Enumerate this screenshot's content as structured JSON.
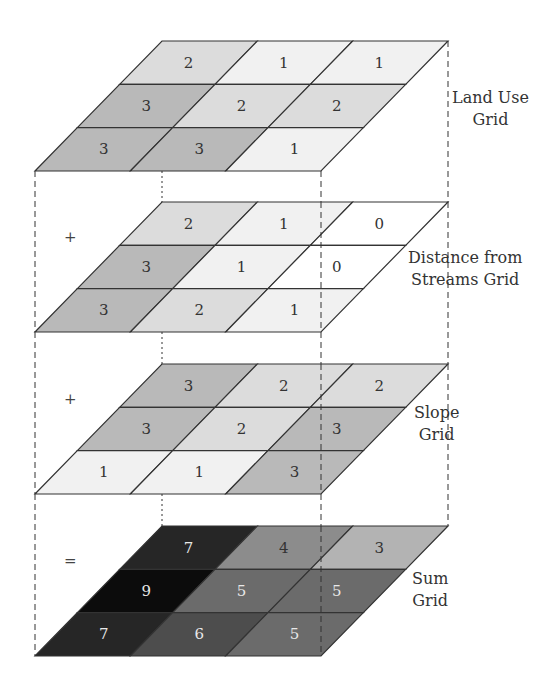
{
  "layers": [
    {
      "name": "land-use-grid",
      "label_line1": "Land Use",
      "label_line2": "Grid",
      "operator": "",
      "top_y": 41,
      "label_x": 452,
      "label_y": 109,
      "values": [
        [
          2,
          1,
          1
        ],
        [
          3,
          2,
          2
        ],
        [
          3,
          3,
          1
        ]
      ]
    },
    {
      "name": "distance-from-streams-grid",
      "label_line1": "Distance from",
      "label_line2": "Streams Grid",
      "operator": "+",
      "top_y": 202,
      "label_x": 408,
      "label_y": 269,
      "values": [
        [
          2,
          1,
          0
        ],
        [
          3,
          1,
          0
        ],
        [
          3,
          2,
          1
        ]
      ]
    },
    {
      "name": "slope-grid",
      "label_line1": "Slope",
      "label_line2": "Grid",
      "operator": "+",
      "top_y": 364,
      "label_x": 414,
      "label_y": 424,
      "values": [
        [
          3,
          2,
          2
        ],
        [
          3,
          2,
          3
        ],
        [
          1,
          1,
          3
        ]
      ]
    },
    {
      "name": "sum-grid",
      "label_line1": "Sum",
      "label_line2": "Grid",
      "operator": "=",
      "top_y": 526,
      "label_x": 412,
      "label_y": 590,
      "values": [
        [
          7,
          4,
          3
        ],
        [
          9,
          5,
          5
        ],
        [
          7,
          6,
          5
        ]
      ]
    }
  ],
  "colors": {
    "input_scale": {
      "0": "#ffffff",
      "1": "#f1f1f1",
      "2": "#dcdcdc",
      "3": "#b9b9b9"
    },
    "sum_scale": {
      "3": "#b3b3b3",
      "4": "#8c8c8c",
      "5": "#6b6b6b",
      "6": "#4d4d4d",
      "7": "#262626",
      "9": "#0c0c0c"
    },
    "line": "#333333",
    "text_dark": "#333333",
    "text_light": "#e8e8e8"
  }
}
